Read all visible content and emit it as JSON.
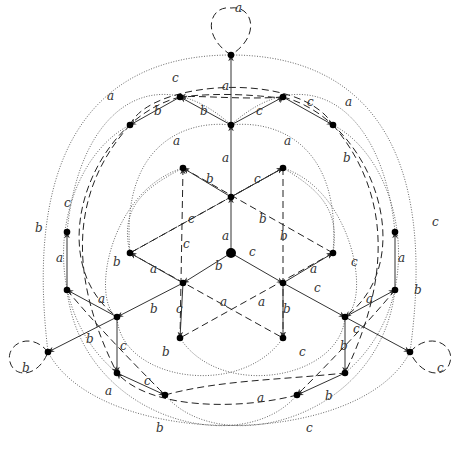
{
  "diagram": {
    "generators": [
      "a",
      "b",
      "c"
    ],
    "edge_styles": {
      "a-solid": "solid",
      "dashed": "dashed",
      "dotted": "dotted"
    },
    "nodes": [
      {
        "id": "top",
        "x": 231,
        "y": 55
      },
      {
        "id": "n1",
        "x": 231,
        "y": 125
      },
      {
        "id": "n2",
        "x": 180,
        "y": 97
      },
      {
        "id": "n3",
        "x": 283,
        "y": 97
      },
      {
        "id": "n4",
        "x": 130,
        "y": 125
      },
      {
        "id": "n5",
        "x": 333,
        "y": 125
      },
      {
        "id": "i1",
        "x": 183,
        "y": 168
      },
      {
        "id": "i2",
        "x": 283,
        "y": 168
      },
      {
        "id": "i3",
        "x": 231,
        "y": 197
      },
      {
        "id": "center",
        "x": 231,
        "y": 253
      },
      {
        "id": "i4",
        "x": 183,
        "y": 283
      },
      {
        "id": "i5",
        "x": 283,
        "y": 283
      },
      {
        "id": "i6",
        "x": 130,
        "y": 253
      },
      {
        "id": "i7",
        "x": 333,
        "y": 253
      },
      {
        "id": "i8",
        "x": 180,
        "y": 338
      },
      {
        "id": "i9",
        "x": 283,
        "y": 338
      },
      {
        "id": "l1",
        "x": 67,
        "y": 232
      },
      {
        "id": "l2",
        "x": 67,
        "y": 290
      },
      {
        "id": "l3",
        "x": 117,
        "y": 317
      },
      {
        "id": "left",
        "x": 48,
        "y": 352
      },
      {
        "id": "r1",
        "x": 395,
        "y": 232
      },
      {
        "id": "r2",
        "x": 395,
        "y": 290
      },
      {
        "id": "r3",
        "x": 345,
        "y": 317
      },
      {
        "id": "right",
        "x": 410,
        "y": 352
      },
      {
        "id": "b1",
        "x": 117,
        "y": 373
      },
      {
        "id": "b2",
        "x": 165,
        "y": 395
      },
      {
        "id": "b3",
        "x": 297,
        "y": 395
      },
      {
        "id": "b4",
        "x": 345,
        "y": 373
      }
    ],
    "loops": [
      {
        "node": "top",
        "label": "a"
      },
      {
        "node": "left",
        "label": "b"
      },
      {
        "node": "right",
        "label": "c"
      }
    ],
    "labels": [
      {
        "t": "a",
        "x": 235,
        "y": 12
      },
      {
        "t": "a",
        "x": 222,
        "y": 90
      },
      {
        "t": "c",
        "x": 172,
        "y": 82
      },
      {
        "t": "b",
        "x": 154,
        "y": 115
      },
      {
        "t": "b",
        "x": 200,
        "y": 115
      },
      {
        "t": "c",
        "x": 256,
        "y": 115
      },
      {
        "t": "c",
        "x": 307,
        "y": 106
      },
      {
        "t": "a",
        "x": 107,
        "y": 100
      },
      {
        "t": "a",
        "x": 345,
        "y": 106
      },
      {
        "t": "a",
        "x": 222,
        "y": 162
      },
      {
        "t": "a",
        "x": 173,
        "y": 145
      },
      {
        "t": "a",
        "x": 284,
        "y": 145
      },
      {
        "t": "b",
        "x": 206,
        "y": 183
      },
      {
        "t": "c",
        "x": 254,
        "y": 183
      },
      {
        "t": "b",
        "x": 343,
        "y": 162
      },
      {
        "t": "c",
        "x": 188,
        "y": 223
      },
      {
        "t": "b",
        "x": 259,
        "y": 223
      },
      {
        "t": "a",
        "x": 222,
        "y": 240
      },
      {
        "t": "c",
        "x": 183,
        "y": 248
      },
      {
        "t": "b",
        "x": 280,
        "y": 240
      },
      {
        "t": "c",
        "x": 249,
        "y": 256
      },
      {
        "t": "b",
        "x": 215,
        "y": 270
      },
      {
        "t": "a",
        "x": 150,
        "y": 273
      },
      {
        "t": "a",
        "x": 310,
        "y": 273
      },
      {
        "t": "a",
        "x": 56,
        "y": 262
      },
      {
        "t": "a",
        "x": 398,
        "y": 262
      },
      {
        "t": "c",
        "x": 64,
        "y": 207
      },
      {
        "t": "b",
        "x": 35,
        "y": 232
      },
      {
        "t": "c",
        "x": 432,
        "y": 226
      },
      {
        "t": "b",
        "x": 113,
        "y": 266
      },
      {
        "t": "c",
        "x": 351,
        "y": 266
      },
      {
        "t": "a",
        "x": 98,
        "y": 303
      },
      {
        "t": "b",
        "x": 150,
        "y": 313
      },
      {
        "t": "c",
        "x": 314,
        "y": 292
      },
      {
        "t": "a",
        "x": 366,
        "y": 303
      },
      {
        "t": "b",
        "x": 414,
        "y": 294
      },
      {
        "t": "c",
        "x": 176,
        "y": 313
      },
      {
        "t": "a",
        "x": 220,
        "y": 306
      },
      {
        "t": "a",
        "x": 258,
        "y": 306
      },
      {
        "t": "b",
        "x": 283,
        "y": 313
      },
      {
        "t": "c",
        "x": 353,
        "y": 333
      },
      {
        "t": "b",
        "x": 86,
        "y": 343
      },
      {
        "t": "c",
        "x": 120,
        "y": 350
      },
      {
        "t": "b",
        "x": 340,
        "y": 350
      },
      {
        "t": "b",
        "x": 162,
        "y": 356
      },
      {
        "t": "c",
        "x": 299,
        "y": 356
      },
      {
        "t": "a",
        "x": 105,
        "y": 395
      },
      {
        "t": "c",
        "x": 144,
        "y": 385
      },
      {
        "t": "a",
        "x": 257,
        "y": 402
      },
      {
        "t": "b",
        "x": 325,
        "y": 400
      },
      {
        "t": "b",
        "x": 156,
        "y": 432
      },
      {
        "t": "c",
        "x": 306,
        "y": 432
      },
      {
        "t": "b",
        "x": 22,
        "y": 372
      },
      {
        "t": "c",
        "x": 437,
        "y": 372
      }
    ]
  }
}
